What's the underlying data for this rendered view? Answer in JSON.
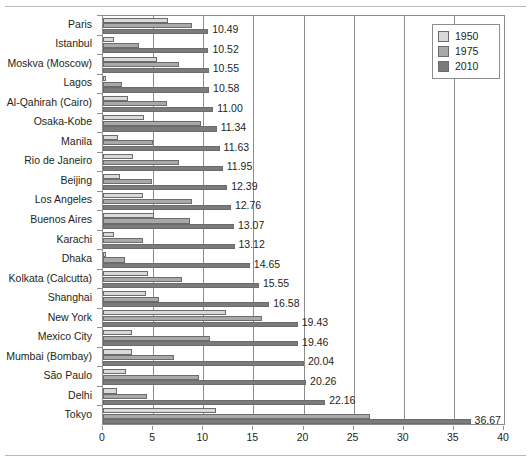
{
  "chart_data": {
    "type": "bar",
    "orientation": "horizontal",
    "title": "",
    "xlabel": "",
    "ylabel": "",
    "xlim": [
      0,
      40
    ],
    "xticks": [
      0,
      5,
      10,
      15,
      20,
      25,
      30,
      35,
      40
    ],
    "xtick_labels": [
      "0",
      "5",
      "10",
      "15",
      "20",
      "25",
      "30",
      "35",
      "40"
    ],
    "grid": "vertical",
    "legend_position": "top-right",
    "legend": [
      "1950",
      "1975",
      "2010"
    ],
    "series": [
      {
        "name": "1950",
        "color": "#d9d9d9",
        "values": [
          6.5,
          1.1,
          5.4,
          0.3,
          2.5,
          4.1,
          1.5,
          3.0,
          1.7,
          4.0,
          5.1,
          1.1,
          0.3,
          4.5,
          4.3,
          12.3,
          2.9,
          2.9,
          2.3,
          1.4,
          11.3
        ]
      },
      {
        "name": "1975",
        "color": "#a9a9a9",
        "values": [
          8.9,
          3.6,
          7.6,
          1.9,
          6.4,
          9.8,
          5.0,
          7.6,
          4.9,
          8.9,
          8.7,
          4.0,
          2.2,
          7.9,
          5.6,
          15.9,
          10.7,
          7.1,
          9.6,
          4.4,
          26.6
        ]
      },
      {
        "name": "2010",
        "color": "#7b7b7b",
        "values": [
          10.49,
          10.52,
          10.55,
          10.58,
          11.0,
          11.34,
          11.63,
          11.95,
          12.39,
          12.76,
          13.07,
          13.12,
          14.65,
          15.55,
          16.58,
          19.43,
          19.46,
          20.04,
          20.26,
          22.16,
          36.67
        ]
      }
    ],
    "categories": [
      "Paris",
      "Istanbul",
      "Moskva (Moscow)",
      "Lagos",
      "Al-Qahirah (Cairo)",
      "Osaka-Kobe",
      "Manila",
      "Rio de Janeiro",
      "Beijing",
      "Los Angeles",
      "Buenos Aires",
      "Karachi",
      "Dhaka",
      "Kolkata (Calcutta)",
      "Shanghai",
      "New York",
      "Mexico City",
      "Mumbai (Bombay)",
      "São Paulo",
      "Delhi",
      "Tokyo"
    ],
    "data_labels": [
      "10.49",
      "10.52",
      "10.55",
      "10.58",
      "11.00",
      "11.34",
      "11.63",
      "11.95",
      "12.39",
      "12.76",
      "13.07",
      "13.12",
      "14.65",
      "15.55",
      "16.58",
      "19.43",
      "19.46",
      "20.04",
      "20.26",
      "22.16",
      "36.67"
    ]
  }
}
